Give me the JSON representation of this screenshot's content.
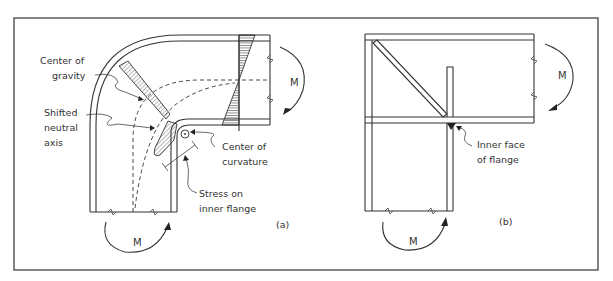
{
  "figure": {
    "panel_a": {
      "label": "(a)",
      "labels": {
        "center_of_gravity": [
          "Center of",
          "gravity"
        ],
        "shifted_neutral_axis": [
          "Shifted",
          "neutral",
          "axis"
        ],
        "center_of_curvature": [
          "Center of",
          "curvature"
        ],
        "stress_on_inner_flange": [
          "Stress on",
          "inner flange"
        ]
      },
      "moment_top": "M",
      "moment_bottom": "M"
    },
    "panel_b": {
      "label": "(b)",
      "labels": {
        "inner_face_of_flange": [
          "Inner face",
          "of flange"
        ]
      },
      "moment_top": "M",
      "moment_bottom": "M"
    }
  }
}
